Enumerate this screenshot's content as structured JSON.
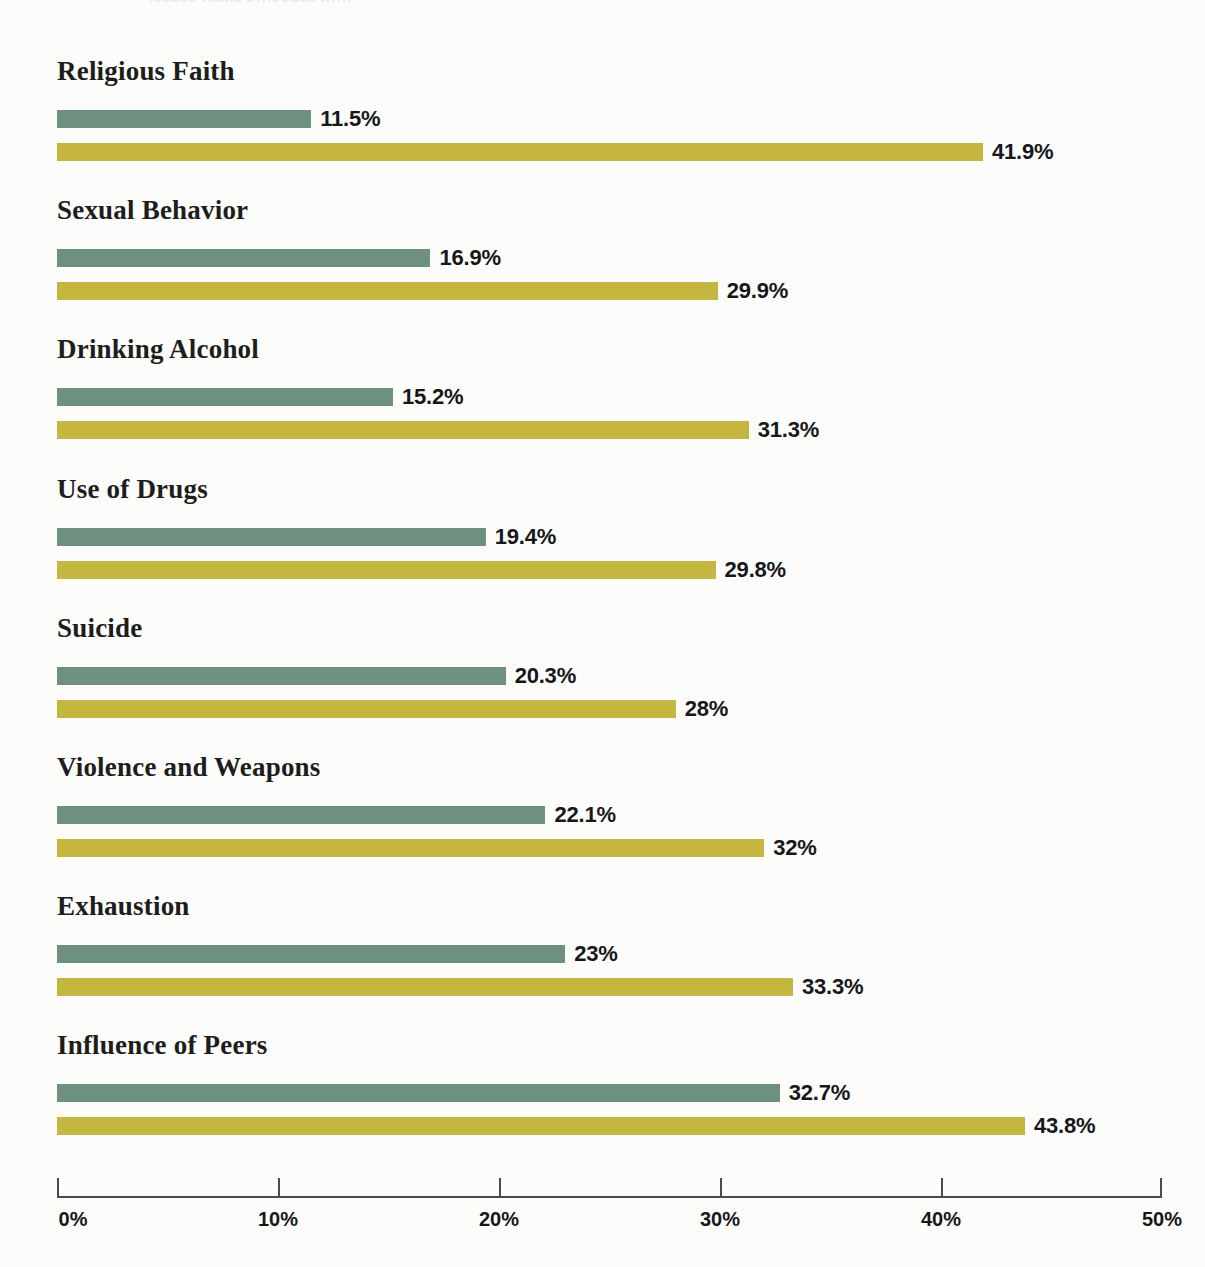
{
  "page": {
    "background_color": "#fcfcfa",
    "top_cutoff_text": "ISSUES TEENS STRUGGLE WITH"
  },
  "chart_data": {
    "type": "bar",
    "orientation": "horizontal",
    "title": "",
    "subtitle": "",
    "xlabel": "",
    "ylabel": "",
    "xlim": [
      0,
      50
    ],
    "grid": false,
    "legend_position": "none",
    "tick_labels": [
      "0%",
      "10%",
      "20%",
      "30%",
      "40%",
      "50%"
    ],
    "ticks": [
      0,
      10,
      20,
      30,
      40,
      50
    ],
    "categories": [
      "Religious Faith",
      "Sexual Behavior",
      "Drinking Alcohol",
      "Use of Drugs",
      "Suicide",
      "Violence and Weapons",
      "Exhaustion",
      "Influence of Peers"
    ],
    "series": [
      {
        "name": "series-green",
        "color": "#6d9080",
        "values": [
          11.5,
          16.9,
          15.2,
          19.4,
          20.3,
          22.1,
          23,
          32.7
        ],
        "labels": [
          "11.5%",
          "16.9%",
          "15.2%",
          "19.4%",
          "20.3%",
          "22.1%",
          "23%",
          "32.7%"
        ]
      },
      {
        "name": "series-gold",
        "color": "#c4b63e",
        "values": [
          41.9,
          29.9,
          31.3,
          29.8,
          28,
          32,
          33.3,
          43.8
        ],
        "labels": [
          "41.9%",
          "29.9%",
          "31.3%",
          "29.8%",
          "28%",
          "32%",
          "33.3%",
          "43.8%"
        ]
      }
    ]
  }
}
